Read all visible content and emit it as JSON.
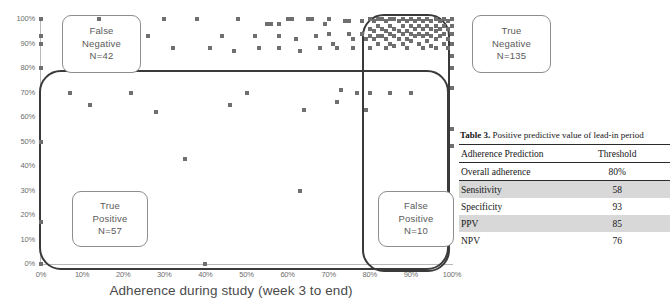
{
  "chart_data": {
    "type": "scatter",
    "title": "",
    "xlabel": "Adherence during study (week 3 to end)",
    "ylabel": "",
    "xlim": [
      0,
      100
    ],
    "ylim": [
      0,
      100
    ],
    "grid": false,
    "xticks": [
      "0%",
      "10%",
      "20%",
      "30%",
      "40%",
      "50%",
      "60%",
      "70%",
      "80%",
      "90%",
      "100%"
    ],
    "yticks": [
      "0%",
      "10%",
      "20%",
      "30%",
      "40%",
      "50%",
      "60%",
      "70%",
      "80%",
      "90%",
      "100%"
    ],
    "points": [
      [
        0,
        100
      ],
      [
        0,
        93
      ],
      [
        0,
        90
      ],
      [
        0,
        80
      ],
      [
        0,
        50
      ],
      [
        0,
        17
      ],
      [
        0,
        0
      ],
      [
        7,
        70
      ],
      [
        12,
        65
      ],
      [
        14,
        100
      ],
      [
        22,
        70
      ],
      [
        26,
        93
      ],
      [
        28,
        62
      ],
      [
        30,
        100
      ],
      [
        32,
        88
      ],
      [
        35,
        43
      ],
      [
        38,
        100
      ],
      [
        40,
        0
      ],
      [
        41,
        88
      ],
      [
        44,
        93
      ],
      [
        46,
        65
      ],
      [
        47,
        87
      ],
      [
        48,
        100
      ],
      [
        50,
        70
      ],
      [
        52,
        93
      ],
      [
        53,
        88
      ],
      [
        55,
        98
      ],
      [
        56,
        98
      ],
      [
        58,
        98
      ],
      [
        58,
        93
      ],
      [
        58,
        88
      ],
      [
        60,
        100
      ],
      [
        61,
        100
      ],
      [
        62,
        92
      ],
      [
        63,
        87
      ],
      [
        64,
        63
      ],
      [
        65,
        100
      ],
      [
        66,
        100
      ],
      [
        67,
        93
      ],
      [
        68,
        88
      ],
      [
        69,
        98
      ],
      [
        70,
        100
      ],
      [
        70,
        94
      ],
      [
        71,
        90
      ],
      [
        72,
        88
      ],
      [
        72,
        66
      ],
      [
        73,
        71
      ],
      [
        74,
        99
      ],
      [
        75,
        99
      ],
      [
        75,
        94
      ],
      [
        76,
        92
      ],
      [
        76,
        88
      ],
      [
        77,
        70
      ],
      [
        78,
        99
      ],
      [
        78,
        94
      ],
      [
        79,
        92
      ],
      [
        79,
        63
      ],
      [
        80,
        100
      ],
      [
        80,
        96
      ],
      [
        80,
        93
      ],
      [
        80,
        88
      ],
      [
        80,
        70
      ],
      [
        81,
        99
      ],
      [
        81,
        95
      ],
      [
        81,
        92
      ],
      [
        82,
        100
      ],
      [
        82,
        97
      ],
      [
        82,
        93
      ],
      [
        82,
        90
      ],
      [
        83,
        100
      ],
      [
        83,
        96
      ],
      [
        83,
        93
      ],
      [
        84,
        99
      ],
      [
        84,
        95
      ],
      [
        84,
        92
      ],
      [
        84,
        88
      ],
      [
        85,
        100
      ],
      [
        85,
        97
      ],
      [
        85,
        94
      ],
      [
        85,
        90
      ],
      [
        85,
        70
      ],
      [
        86,
        100
      ],
      [
        86,
        96
      ],
      [
        86,
        93
      ],
      [
        86,
        89
      ],
      [
        87,
        99
      ],
      [
        87,
        95
      ],
      [
        87,
        92
      ],
      [
        88,
        100
      ],
      [
        88,
        97
      ],
      [
        88,
        94
      ],
      [
        88,
        90
      ],
      [
        89,
        99
      ],
      [
        89,
        95
      ],
      [
        89,
        92
      ],
      [
        89,
        88
      ],
      [
        90,
        100
      ],
      [
        90,
        97
      ],
      [
        90,
        94
      ],
      [
        90,
        91
      ],
      [
        90,
        70
      ],
      [
        91,
        99
      ],
      [
        91,
        96
      ],
      [
        91,
        93
      ],
      [
        92,
        100
      ],
      [
        92,
        97
      ],
      [
        92,
        94
      ],
      [
        92,
        90
      ],
      [
        93,
        99
      ],
      [
        93,
        96
      ],
      [
        93,
        93
      ],
      [
        93,
        88
      ],
      [
        94,
        100
      ],
      [
        94,
        97
      ],
      [
        94,
        94
      ],
      [
        94,
        91
      ],
      [
        95,
        99
      ],
      [
        95,
        96
      ],
      [
        95,
        93
      ],
      [
        95,
        89
      ],
      [
        96,
        100
      ],
      [
        96,
        97
      ],
      [
        96,
        95
      ],
      [
        96,
        92
      ],
      [
        96,
        88
      ],
      [
        97,
        99
      ],
      [
        97,
        96
      ],
      [
        97,
        93
      ],
      [
        98,
        100
      ],
      [
        98,
        97
      ],
      [
        98,
        94
      ],
      [
        98,
        90
      ],
      [
        99,
        99
      ],
      [
        99,
        96
      ],
      [
        99,
        92
      ],
      [
        99,
        88
      ],
      [
        100,
        100
      ],
      [
        100,
        97
      ],
      [
        100,
        94
      ],
      [
        100,
        90
      ],
      [
        100,
        85
      ],
      [
        100,
        80
      ],
      [
        100,
        72
      ],
      [
        100,
        55
      ],
      [
        100,
        48
      ],
      [
        63,
        30
      ]
    ],
    "annotations": [
      {
        "label": "False Negative",
        "count": "N=42"
      },
      {
        "label": "True Negative",
        "count": "N=135"
      },
      {
        "label": "True Positive",
        "count": "N=57"
      },
      {
        "label": "False Positive",
        "count": "N=10"
      }
    ]
  },
  "callouts": {
    "false_negative": {
      "line1": "False",
      "line2": "Negative",
      "line3": "N=42"
    },
    "true_negative": {
      "line1": "True",
      "line2": "Negative",
      "line3": "N=135"
    },
    "true_positive": {
      "line1": "True",
      "line2": "Positive",
      "line3": "N=57"
    },
    "false_positive": {
      "line1": "False",
      "line2": "Positive",
      "line3": "N=10"
    }
  },
  "table": {
    "caption_label": "Table 3.",
    "caption_text": " Positive predictive value of lead-in period",
    "header": {
      "col1": "Adherence Prediction",
      "col2": "Threshold"
    },
    "rows": [
      {
        "label": "Overall adherence",
        "value": "80%",
        "shaded": false
      },
      {
        "label": "Sensitivity",
        "value": "58",
        "shaded": true
      },
      {
        "label": "Specificity",
        "value": "93",
        "shaded": false
      },
      {
        "label": "PPV",
        "value": "85",
        "shaded": true
      },
      {
        "label": "NPV",
        "value": "76",
        "shaded": false
      }
    ]
  },
  "colors": {
    "point": "#6f6f6f",
    "region_border": "#3a3a3a",
    "callout_border": "#8d8d8d",
    "axis": "#b8b8b8",
    "table_shade": "#d8d8d8"
  }
}
